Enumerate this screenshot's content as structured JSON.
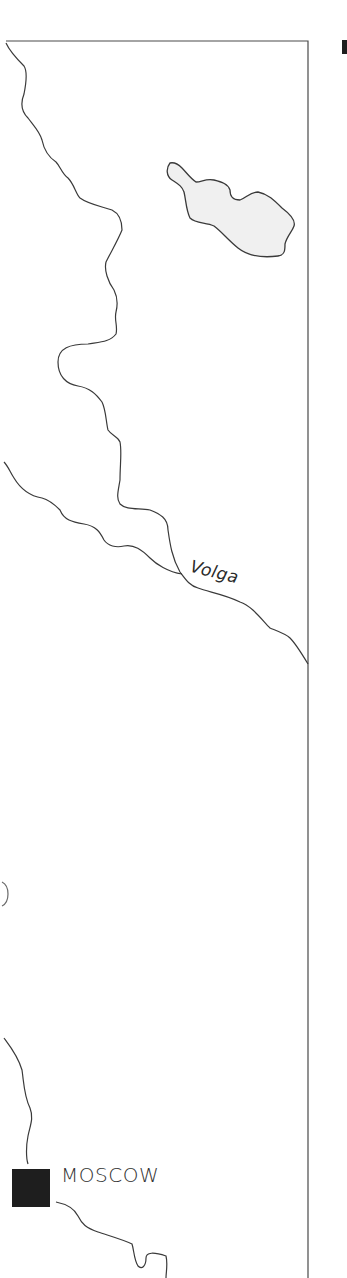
{
  "map": {
    "labels": {
      "river": "Volga",
      "city": "MOSCOW"
    },
    "features": [
      {
        "type": "river",
        "name": "Volga"
      },
      {
        "type": "river",
        "name": "tributary"
      },
      {
        "type": "lake",
        "name": "lake"
      },
      {
        "type": "city",
        "name": "MOSCOW",
        "marker": "filled-square"
      }
    ],
    "colors": {
      "background": "#ffffff",
      "line": "#3a3a3a",
      "lake_fill": "#f0f0f0",
      "city_marker": "#1e1e1e"
    }
  }
}
